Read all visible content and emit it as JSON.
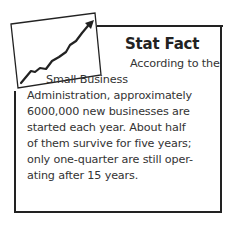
{
  "sidebar_box": {
    "icon": "rising-line-chart-icon",
    "title": "Stat Fact",
    "lines": [
      "According to the",
      "Small Business",
      "Administration, approximately",
      "6000,000 new businesses are",
      "started each year. About half",
      "of them survive for five years;",
      "only one-quarter are still oper-",
      "ating after 15 years."
    ]
  }
}
